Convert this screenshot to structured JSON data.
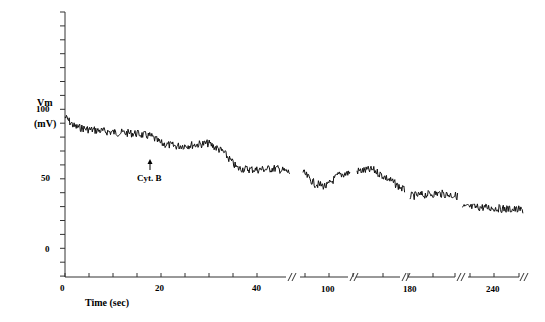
{
  "chart_data": {
    "type": "line",
    "title": "",
    "xlabel": "Time (sec)",
    "ylabel": "Vm",
    "ylabel_unit": "(mV)",
    "ylim": [
      -20,
      170
    ],
    "y_ticks": [
      0,
      50,
      100
    ],
    "x_tick_labels": [
      "0",
      "20",
      "40",
      "100",
      "180",
      "240"
    ],
    "axis_breaks": true,
    "grid": false,
    "legend": "none",
    "annotations": [
      {
        "text": "Cyt. B",
        "x_sec": 18,
        "type": "arrow-up"
      }
    ],
    "segments": [
      {
        "name": "0-47 s",
        "x": [
          0,
          2,
          5,
          10,
          15,
          18,
          20,
          23,
          27,
          30,
          33,
          36,
          40,
          44,
          47
        ],
        "values": [
          95,
          88,
          86,
          84,
          83,
          81,
          76,
          74,
          75,
          76,
          70,
          58,
          57,
          58,
          55
        ]
      },
      {
        "name": "~90-110 s",
        "x": [
          90,
          95,
          100,
          105,
          110
        ],
        "values": [
          55,
          47,
          45,
          53,
          55
        ]
      },
      {
        "name": "~150-180 s",
        "x": [
          150,
          160,
          170,
          180
        ],
        "values": [
          56,
          57,
          50,
          42
        ]
      },
      {
        "name": "~180-215 s",
        "x": [
          180,
          190,
          200,
          210,
          215
        ],
        "values": [
          38,
          39,
          40,
          39,
          38
        ]
      },
      {
        "name": "~225-255 s",
        "x": [
          225,
          235,
          245,
          255
        ],
        "values": [
          30,
          30,
          29,
          28
        ]
      }
    ]
  },
  "labels": {
    "y_title": "Vm",
    "y_unit": "(mV)",
    "y100": "100",
    "y50": "50",
    "y0": "0",
    "x0": "0",
    "x20": "20",
    "x40": "40",
    "x100": "100",
    "x180": "180",
    "x240": "240",
    "x_title": "Time (sec)",
    "annotation": "Cyt. B"
  }
}
